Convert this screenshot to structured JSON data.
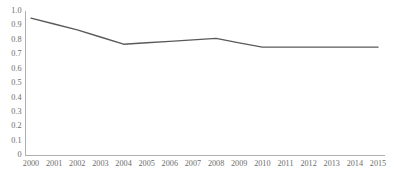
{
  "chart_data": {
    "type": "line",
    "title": "",
    "subtitle": "",
    "xlabel": "",
    "ylabel": "",
    "categories": [
      "2000",
      "2001",
      "2002",
      "2003",
      "2004",
      "2005",
      "2006",
      "2007",
      "2008",
      "2009",
      "2010",
      "2011",
      "2012",
      "2013",
      "2014",
      "2015"
    ],
    "x": [
      2000,
      2001,
      2002,
      2003,
      2004,
      2005,
      2006,
      2007,
      2008,
      2009,
      2010,
      2011,
      2012,
      2013,
      2014,
      2015
    ],
    "values": [
      0.95,
      0.91,
      0.87,
      0.82,
      0.77,
      0.78,
      0.79,
      0.8,
      0.81,
      0.78,
      0.75,
      0.75,
      0.75,
      0.75,
      0.75,
      0.75
    ],
    "series": [
      {
        "name": "series-1",
        "color": "#5a5a5a",
        "values": [
          0.95,
          0.91,
          0.87,
          0.82,
          0.77,
          0.78,
          0.79,
          0.8,
          0.81,
          0.78,
          0.75,
          0.75,
          0.75,
          0.75,
          0.75,
          0.75
        ]
      }
    ],
    "ylim": [
      0,
      1.0
    ],
    "ytick_values": [
      1.0,
      0.9,
      0.8,
      0.7,
      0.6,
      0.5,
      0.4,
      0.3,
      0.2,
      0.1,
      0
    ],
    "ytick_labels": [
      "1.0",
      "0.9",
      "0.8",
      "0.7",
      "0.6",
      "0.5",
      "0.4",
      "0.3",
      "0.2",
      "0.1",
      "0"
    ],
    "xtick_labels": [
      "2000",
      "2001",
      "2002",
      "2003",
      "2004",
      "2005",
      "2006",
      "2007",
      "2008",
      "2009",
      "2010",
      "2011",
      "2012",
      "2013",
      "2014",
      "2015"
    ],
    "grid": false,
    "legend": false,
    "legend_position": "none",
    "markers": false,
    "annotations": [],
    "axis_color": "#a6a6a6",
    "tick_label_color": "#6d6d6d",
    "background": "#ffffff"
  }
}
